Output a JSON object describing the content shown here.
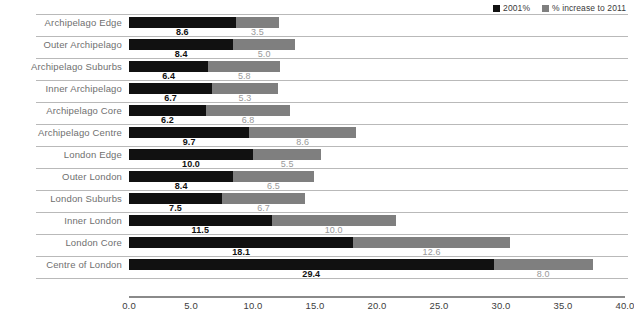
{
  "chart_data": {
    "type": "bar",
    "orientation": "horizontal",
    "stacked": true,
    "title": "",
    "xlabel": "",
    "ylabel": "",
    "xlim": [
      0.0,
      40.0
    ],
    "xticks": [
      "0.0",
      "5.0",
      "10.0",
      "15.0",
      "20.0",
      "25.0",
      "30.0",
      "35.0",
      "40.0"
    ],
    "xtick_values": [
      0,
      5,
      10,
      15,
      20,
      25,
      30,
      35,
      40
    ],
    "grid": true,
    "grid_axis": "y",
    "legend_position": "top-right",
    "categories": [
      "Archipelago Edge",
      "Outer Archipelago",
      "Archipelago Suburbs",
      "Inner Archipelago",
      "Archipelago Core",
      "Archipelago Centre",
      "London Edge",
      "Outer London",
      "London Suburbs",
      "Inner London",
      "London Core",
      "Centre of London"
    ],
    "series": [
      {
        "name": "2001%",
        "color": "#111111",
        "values": [
          8.6,
          8.4,
          6.4,
          6.7,
          6.2,
          9.7,
          10.0,
          8.4,
          7.5,
          11.5,
          18.1,
          29.4
        ],
        "labels": [
          "8.6",
          "8.4",
          "6.4",
          "6.7",
          "6.2",
          "9.7",
          "10.0",
          "8.4",
          "7.5",
          "11.5",
          "18.1",
          "29.4"
        ]
      },
      {
        "name": "% increase to 2011",
        "color": "#7f7f7f",
        "values": [
          3.5,
          5.0,
          5.8,
          5.3,
          6.8,
          8.6,
          5.5,
          6.5,
          6.7,
          10.0,
          12.6,
          8.0
        ],
        "labels": [
          "3.5",
          "5.0",
          "5.8",
          "5.3",
          "6.8",
          "8.6",
          "5.5",
          "6.5",
          "6.7",
          "10.0",
          "12.6",
          "8.0"
        ]
      }
    ]
  },
  "legend": {
    "entries": [
      {
        "label": "2001%",
        "color": "#111111"
      },
      {
        "label": "% increase to 2011",
        "color": "#7f7f7f"
      }
    ]
  }
}
